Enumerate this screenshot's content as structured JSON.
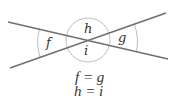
{
  "diagram": {
    "labels": {
      "top": "h",
      "bottom": "i",
      "left": "f",
      "right": "g"
    },
    "equations": [
      "f = g",
      "h = i"
    ],
    "colors": {
      "line": "#707070",
      "arc": "#b8b8b8",
      "text": "#333333"
    }
  }
}
